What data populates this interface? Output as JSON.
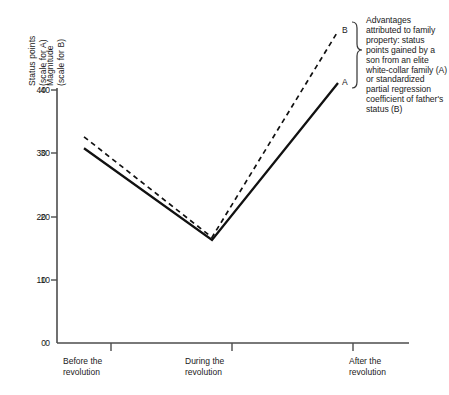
{
  "chart_data": {
    "type": "line",
    "title": "",
    "categories": [
      "Before the revolution",
      "During the revolution",
      "After the revolution"
    ],
    "series": [
      {
        "name": "A",
        "label": "A",
        "style": "solid",
        "axis": "left",
        "values": [
          30.8,
          16.3,
          41.1
        ]
      },
      {
        "name": "B",
        "label": "B",
        "style": "dashed",
        "axis": "right",
        "values": [
          0.326,
          0.167,
          0.493
        ]
      }
    ],
    "xlabel": "",
    "ylabel": "Status points (scale for A) / Magnitude (scale for B)",
    "ylim": [
      0,
      44
    ],
    "y_axis_left": {
      "label_line1": "Status points",
      "label_line2": "(scale for A)",
      "ticks": [
        "40",
        "30",
        "20",
        "10",
        "0"
      ],
      "tick_values": [
        40,
        30,
        20,
        10,
        0
      ]
    },
    "y_axis_right": {
      "label_line1": "Magnitude",
      "label_line2": "(scale for B)",
      "ticks": [
        ".40",
        ".30",
        ".20",
        ".10",
        "0"
      ],
      "tick_values": [
        0.4,
        0.3,
        0.2,
        0.1,
        0
      ]
    },
    "grid": false,
    "legend_position": "right-annotation",
    "annotation": "Advantages attributed to family property: status points gained by a son from an elite white-collar family (A) or standardized partial regression coefficient of father's status (B)",
    "colors": {
      "line": "#111111",
      "axis": "#555555",
      "text": "#1a1a1a",
      "background": "#ffffff"
    }
  },
  "x_labels": [
    {
      "line1": "Before the",
      "line2": "revolution"
    },
    {
      "line1": "During the",
      "line2": "revolution"
    },
    {
      "line1": "After the",
      "line2": "revolution"
    }
  ]
}
